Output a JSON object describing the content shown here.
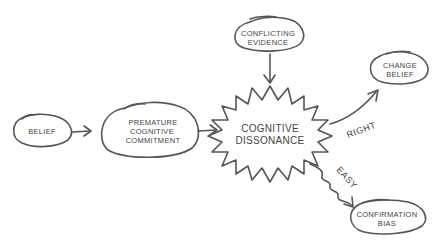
{
  "nodes": {
    "belief": {
      "line1": "BELIEF"
    },
    "premature": {
      "line1": "PREMATURE",
      "line2": "COGNITIVE",
      "line3": "COMMITMENT"
    },
    "conflicting": {
      "line1": "CONFLICTING",
      "line2": "EVIDENCE"
    },
    "dissonance": {
      "line1": "COGNITIVE",
      "line2": "DISSONANCE"
    },
    "change": {
      "line1": "CHANGE",
      "line2": "BELIEF"
    },
    "confirmation": {
      "line1": "CONFIRMATION",
      "line2": "BIAS"
    }
  },
  "edges": {
    "right": "RIGHT",
    "easy": "EASY"
  },
  "colors": {
    "ink": "#555555",
    "text": "#444444",
    "background": "#ffffff"
  }
}
